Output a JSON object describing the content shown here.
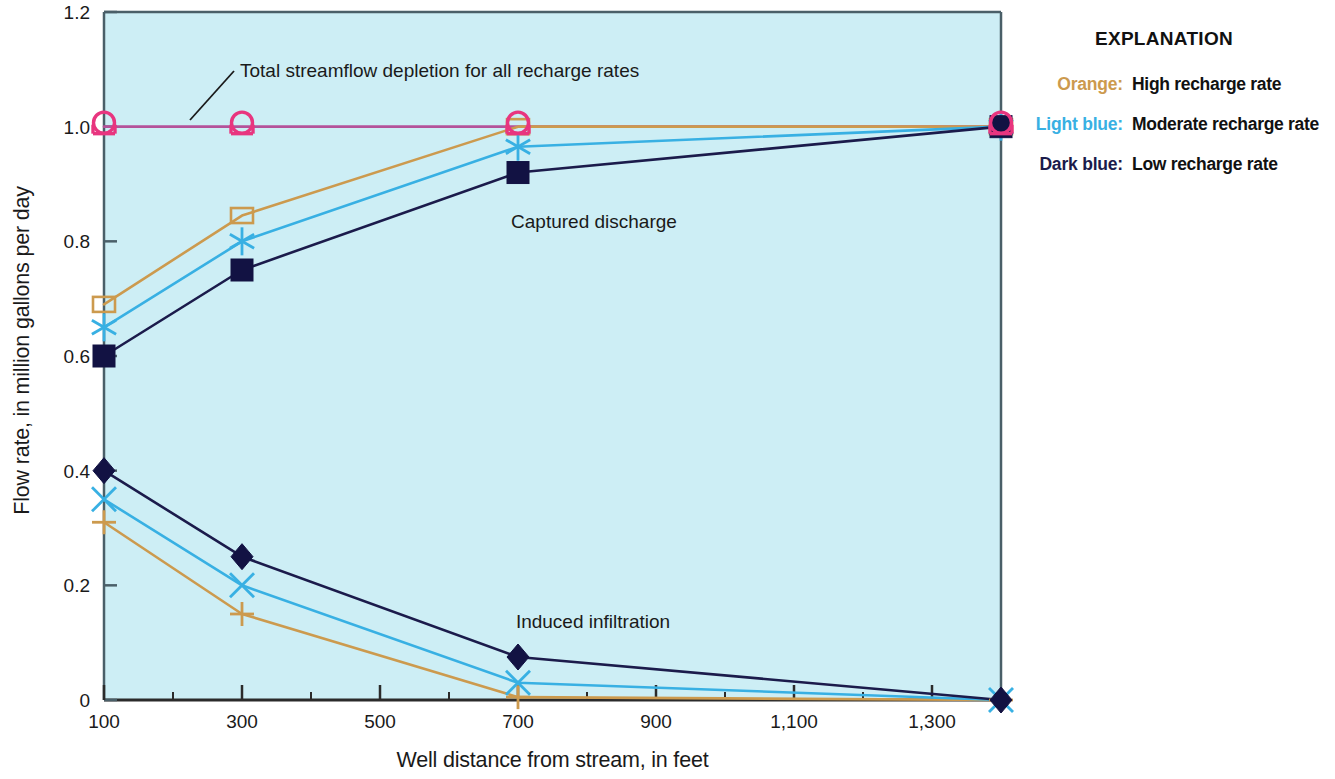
{
  "chart_data": {
    "type": "line",
    "title": "",
    "xlabel": "Well distance from stream, in feet",
    "ylabel": "Flow rate, in million gallons per day",
    "xlim": [
      100,
      1400
    ],
    "ylim": [
      0,
      1.2
    ],
    "xticks": [
      100,
      300,
      500,
      700,
      900,
      1100,
      1300
    ],
    "xtick_labels": [
      "100",
      "300",
      "500",
      "700",
      "900",
      "1,100",
      "1,300"
    ],
    "xminor_ticks": [
      200,
      400,
      600,
      800,
      1000,
      1200,
      1400
    ],
    "yticks": [
      0,
      0.2,
      0.4,
      0.6,
      0.8,
      1.0,
      1.2
    ],
    "ytick_labels": [
      "0",
      "0.2",
      "0.4",
      "0.6",
      "0.8",
      "1.0",
      "1.2"
    ],
    "grid": false,
    "legend_position": "right-outside",
    "plot_bgcolor": "#cdeef5",
    "x": [
      100,
      300,
      700,
      1400
    ],
    "series": [
      {
        "name": "Total streamflow depletion for all recharge rates",
        "group": "depletion",
        "color": "#b4529a",
        "marker": "circle-open-magenta",
        "marker_color": "#e8357f",
        "values": [
          1.0,
          1.0,
          1.0,
          1.0
        ]
      },
      {
        "name": "Captured discharge, high recharge rate",
        "group": "captured",
        "color": "#cc9a4e",
        "marker": "square-open",
        "marker_color": "#cc9a4e",
        "values": [
          0.69,
          0.845,
          1.0,
          1.0
        ]
      },
      {
        "name": "Captured discharge, moderate recharge rate",
        "group": "captured",
        "color": "#38b0e3",
        "marker": "asterisk",
        "marker_color": "#38b0e3",
        "values": [
          0.65,
          0.8,
          0.965,
          1.0
        ]
      },
      {
        "name": "Captured discharge, low recharge rate",
        "group": "captured",
        "color": "#1b1b4b",
        "marker": "square-filled",
        "marker_color": "#121243",
        "values": [
          0.6,
          0.75,
          0.92,
          1.0
        ]
      },
      {
        "name": "Induced infiltration, high recharge rate",
        "group": "infiltration",
        "color": "#cc9a4e",
        "marker": "plus",
        "marker_color": "#cc9a4e",
        "values": [
          0.31,
          0.15,
          0.005,
          0.0
        ]
      },
      {
        "name": "Induced infiltration, moderate recharge rate",
        "group": "infiltration",
        "color": "#38b0e3",
        "marker": "x-cross",
        "marker_color": "#38b0e3",
        "values": [
          0.35,
          0.2,
          0.03,
          0.0
        ]
      },
      {
        "name": "Induced infiltration, low recharge rate",
        "group": "infiltration",
        "color": "#1b1b4b",
        "marker": "diamond-filled",
        "marker_color": "#121243",
        "values": [
          0.4,
          0.25,
          0.075,
          0.0
        ]
      }
    ],
    "annotations": [
      {
        "text": "Total streamflow depletion for all recharge rates",
        "x_px": 240,
        "y_px": 77,
        "anchor": "start",
        "leader": {
          "x1": 234,
          "y1": 71,
          "x2": 190,
          "y2": 120
        }
      },
      {
        "text": "Captured discharge",
        "x_px": 594,
        "y_px": 228,
        "anchor": "middle",
        "leader": null
      },
      {
        "text": "Induced infiltration",
        "x_px": 593,
        "y_px": 628,
        "anchor": "middle",
        "leader": null
      }
    ]
  },
  "legend": {
    "title": "EXPLANATION",
    "rows": [
      {
        "key": "Orange:",
        "key_color": "#cc9a4e",
        "value": "High recharge rate"
      },
      {
        "key": "Light blue:",
        "key_color": "#38b0e3",
        "value": "Moderate recharge rate"
      },
      {
        "key": "Dark blue:",
        "key_color": "#1b1b4b",
        "value": "Low recharge rate"
      }
    ]
  },
  "axes": {
    "x_title": "Well distance from stream, in feet",
    "y_title": "Flow rate, in million gallons per day"
  }
}
